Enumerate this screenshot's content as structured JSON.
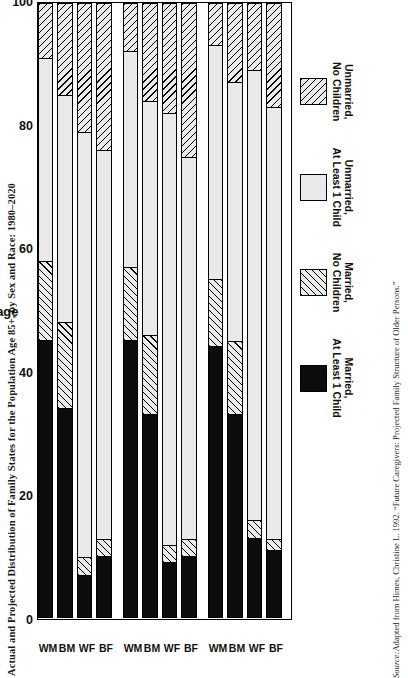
{
  "figure": {
    "title": "Actual and Projected Distribution of Family States for the Population Age 85+, by Sex and Race: 1980–2020",
    "source_word": "Source:",
    "source_text": " Adapted from Himes, Christine L. 1992. “Future Caregivers: Projected Family Structure of Older Persons.”"
  },
  "chart_data": {
    "type": "bar",
    "orientation": "horizontal-stacked-rotated",
    "title": "Actual and Projected Distribution of Family States for the Population Age 85+, by Sex and Race: 1980–2020",
    "xlabel": "",
    "ylabel": "Percentage",
    "ylim": [
      0,
      100
    ],
    "yticks": [
      0,
      20,
      40,
      60,
      80,
      100
    ],
    "grid": false,
    "legend_position": "top",
    "group_labels": [
      "1980",
      "2000",
      "2020"
    ],
    "categories": [
      "WM",
      "BM",
      "WF",
      "BF"
    ],
    "series": [
      {
        "name": "Unmarried,\nNo Children",
        "pattern": "hatch-a",
        "values": {
          "1980": [
            9,
            15,
            21,
            24
          ],
          "2000": [
            8,
            16,
            18,
            25
          ],
          "2020": [
            7,
            13,
            11,
            17
          ]
        }
      },
      {
        "name": "Unmarried,\nAt Least 1 Child",
        "pattern": "solid-light",
        "values": {
          "1980": [
            33,
            37,
            69,
            63
          ],
          "2000": [
            35,
            38,
            70,
            62
          ],
          "2020": [
            38,
            42,
            73,
            70
          ]
        }
      },
      {
        "name": "Married,\nNo Children",
        "pattern": "hatch-b",
        "values": {
          "1980": [
            13,
            14,
            3,
            3
          ],
          "2000": [
            12,
            13,
            3,
            3
          ],
          "2020": [
            11,
            12,
            3,
            2
          ]
        }
      },
      {
        "name": "Married,\nAt Least 1 Child",
        "pattern": "black",
        "values": {
          "1980": [
            45,
            34,
            7,
            10
          ],
          "2000": [
            45,
            33,
            9,
            10
          ],
          "2020": [
            44,
            33,
            13,
            11
          ]
        }
      }
    ]
  },
  "legend": {
    "items": [
      {
        "label": "Unmarried,\nNo Children",
        "swatch": "hatch-a"
      },
      {
        "label": "Unmarried,\nAt Least 1 Child",
        "swatch": "solid-light"
      },
      {
        "label": "Married,\nNo Children",
        "swatch": "hatch-b"
      },
      {
        "label": "Married,\nAt Least 1 Child",
        "swatch": "black"
      }
    ]
  },
  "axis": {
    "value_title": "Percentage",
    "ticks": [
      "100",
      "80",
      "60",
      "40",
      "20",
      "0"
    ]
  }
}
